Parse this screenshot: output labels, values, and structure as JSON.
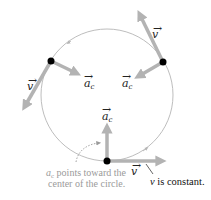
{
  "diagram": {
    "colors": {
      "circle": "#b5b5b5",
      "vector": "#b3b3b3",
      "particle": "#000000",
      "annotation": "#9a9a9a",
      "text": "#111111"
    },
    "particles": [
      {
        "name": "left",
        "velocity_label": "v",
        "acceleration_label": "a",
        "acceleration_subscript": "c"
      },
      {
        "name": "right",
        "velocity_label": "v",
        "acceleration_label": "a",
        "acceleration_subscript": "c"
      },
      {
        "name": "bottom",
        "velocity_label": "v",
        "acceleration_label": "a",
        "acceleration_subscript": "c"
      }
    ],
    "annotations": {
      "ac_note_symbol": "a",
      "ac_note_subscript": "c",
      "ac_note_line1_rest": " points toward the",
      "ac_note_line2": "center of the circle.",
      "v_note_var": "v",
      "v_note_rest": " is constant."
    }
  }
}
